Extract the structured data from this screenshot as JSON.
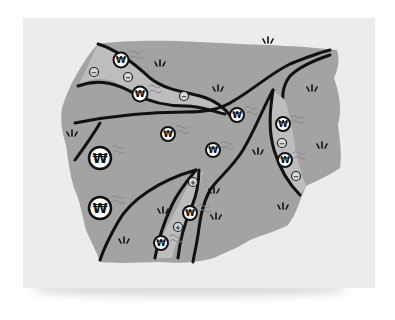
{
  "illustration": {
    "subject": "Gray landmass map with black river channels carrying Korean Won coins",
    "colors": {
      "page_background": "#ffffff",
      "paper": "#ececec",
      "land": "#a3a3a3",
      "river": "#bdbdbd",
      "outline": "#111111",
      "coin_fill": "#ffffff"
    },
    "coin_symbol": "₩",
    "minus_symbol": "−",
    "plus_symbol": "+",
    "coins_large": [
      {
        "x": 100,
        "y": 158,
        "r": 11
      },
      {
        "x": 100,
        "y": 208,
        "r": 11
      }
    ],
    "coins_medium": [
      {
        "x": 121,
        "y": 60,
        "r": 7.5
      },
      {
        "x": 140,
        "y": 94,
        "r": 7.5
      },
      {
        "x": 168,
        "y": 134,
        "r": 7
      },
      {
        "x": 213,
        "y": 150,
        "r": 7
      },
      {
        "x": 237,
        "y": 115,
        "r": 7
      },
      {
        "x": 283,
        "y": 124,
        "r": 7
      },
      {
        "x": 285,
        "y": 160,
        "r": 7
      },
      {
        "x": 190,
        "y": 213,
        "r": 7
      },
      {
        "x": 161,
        "y": 243,
        "r": 7
      }
    ],
    "minus_markers": [
      {
        "x": 94,
        "y": 72
      },
      {
        "x": 128,
        "y": 77
      },
      {
        "x": 184,
        "y": 96
      },
      {
        "x": 282,
        "y": 143
      },
      {
        "x": 296,
        "y": 176
      }
    ],
    "plus_markers": [
      {
        "x": 193,
        "y": 182
      },
      {
        "x": 178,
        "y": 227
      }
    ],
    "grass_tufts": [
      {
        "x": 160,
        "y": 65
      },
      {
        "x": 268,
        "y": 42
      },
      {
        "x": 218,
        "y": 90
      },
      {
        "x": 312,
        "y": 90
      },
      {
        "x": 72,
        "y": 135
      },
      {
        "x": 322,
        "y": 147
      },
      {
        "x": 258,
        "y": 153
      },
      {
        "x": 163,
        "y": 212
      },
      {
        "x": 214,
        "y": 192
      },
      {
        "x": 216,
        "y": 218
      },
      {
        "x": 283,
        "y": 208
      },
      {
        "x": 124,
        "y": 242
      }
    ]
  }
}
